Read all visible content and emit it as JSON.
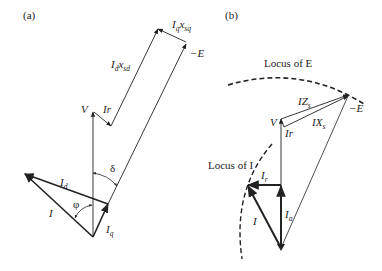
{
  "panels": {
    "a": {
      "label": "(a)",
      "vectors": {
        "V": "V",
        "Ir": "Ir",
        "Id_xsd": {
          "main": "I",
          "sub1": "d",
          "mid": "x",
          "sub2": "sd"
        },
        "Iq_xsq": {
          "main": "I",
          "sub1": "q",
          "mid": "x",
          "sub2": "sq"
        },
        "negE": "−E",
        "Id": {
          "main": "I",
          "sub": "d"
        },
        "Iq": {
          "main": "I",
          "sub": "q"
        },
        "I": "I"
      },
      "angles": {
        "delta": "δ",
        "phi": "φ"
      }
    },
    "b": {
      "label": "(b)",
      "locus_E": "Locus of E",
      "locus_I": "Locus of I",
      "vectors": {
        "V": "V",
        "Ir": "Ir",
        "IZs": {
          "main": "IZ",
          "sub": "s"
        },
        "IXs": {
          "main": "IX",
          "sub": "s"
        },
        "negE": "−E",
        "Ir_reactive": {
          "main": "I",
          "sub": "r"
        },
        "Ia": {
          "main": "I",
          "sub": "a"
        },
        "I": "I"
      }
    }
  },
  "colors": {
    "line": "#222222",
    "background": "#ffffff"
  }
}
